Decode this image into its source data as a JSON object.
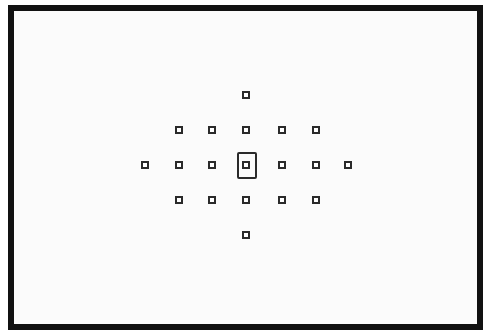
{
  "diagram": {
    "type": "af-point-layout",
    "frame_color": "#111111",
    "point_color": "#2a2a2a",
    "points": [
      {
        "id": "top",
        "x": 246,
        "y": 95
      },
      {
        "id": "r2c1",
        "x": 179,
        "y": 130
      },
      {
        "id": "r2c2",
        "x": 212,
        "y": 130
      },
      {
        "id": "r2c3",
        "x": 246,
        "y": 130
      },
      {
        "id": "r2c4",
        "x": 282,
        "y": 130
      },
      {
        "id": "r2c5",
        "x": 316,
        "y": 130
      },
      {
        "id": "r3c0",
        "x": 145,
        "y": 165
      },
      {
        "id": "r3c1",
        "x": 179,
        "y": 165
      },
      {
        "id": "r3c2",
        "x": 212,
        "y": 165
      },
      {
        "id": "center",
        "x": 246,
        "y": 165,
        "selected": true
      },
      {
        "id": "r3c4",
        "x": 282,
        "y": 165
      },
      {
        "id": "r3c5",
        "x": 316,
        "y": 165
      },
      {
        "id": "r3c6",
        "x": 348,
        "y": 165
      },
      {
        "id": "r4c1",
        "x": 179,
        "y": 200
      },
      {
        "id": "r4c2",
        "x": 212,
        "y": 200
      },
      {
        "id": "r4c3",
        "x": 246,
        "y": 200
      },
      {
        "id": "r4c4",
        "x": 282,
        "y": 200
      },
      {
        "id": "r4c5",
        "x": 316,
        "y": 200
      },
      {
        "id": "bottom",
        "x": 246,
        "y": 235
      }
    ],
    "selected_box": {
      "x": 237,
      "y": 152,
      "w": 20,
      "h": 27
    }
  }
}
